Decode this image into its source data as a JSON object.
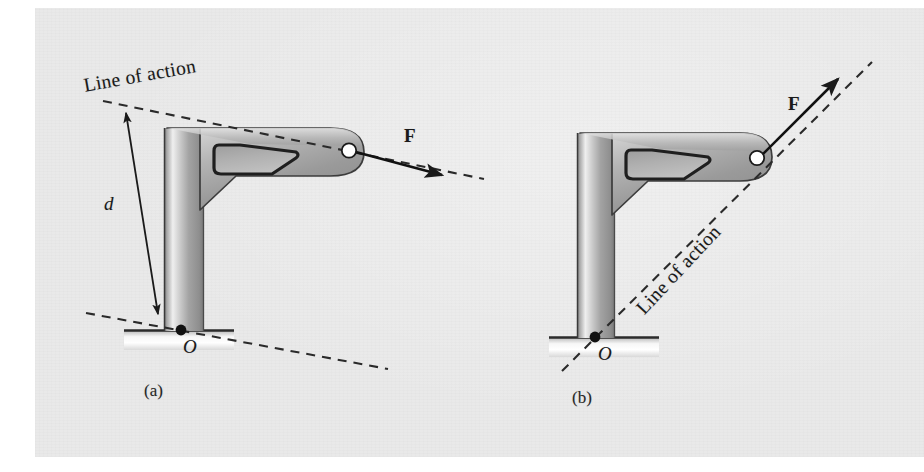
{
  "figure": {
    "kind": "engineering-mechanics-diagram",
    "background_color": "#e9e9e9",
    "ink_color": "#1a1a1a",
    "metal_light": "#f2f2f2",
    "metal_mid": "#9a9a9a",
    "metal_dark": "#5e5e5e"
  },
  "panels": [
    {
      "id": "a",
      "caption": "(a)",
      "labels": {
        "line_of_action": "Line of action",
        "force": "F",
        "moment_arm": "d",
        "pivot": "O"
      },
      "geometry": {
        "line_of_action_angle_deg": 11,
        "force_arrow_angle_deg": 12,
        "dimension_arrow_angle_deg": 77
      }
    },
    {
      "id": "b",
      "caption": "(b)",
      "labels": {
        "line_of_action": "Line of action",
        "force": "F",
        "pivot": "O"
      },
      "geometry": {
        "line_of_action_angle_deg": -47,
        "force_arrow_angle_deg": -47
      }
    }
  ]
}
